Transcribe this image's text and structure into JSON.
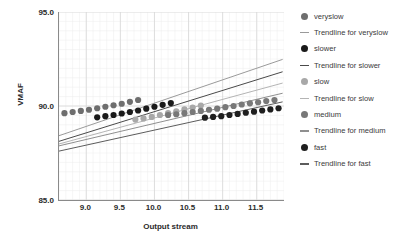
{
  "chart_data": {
    "type": "scatter",
    "title": "",
    "xlabel": "Output stream",
    "ylabel": "VMAF",
    "xlim": [
      8.6,
      11.9
    ],
    "ylim": [
      85.0,
      95.0
    ],
    "grid": true,
    "legend_position": "right",
    "xticks": [
      "9.0",
      "9.5",
      "10.0",
      "10.5",
      "11.0",
      "11.5"
    ],
    "xtick_values": [
      9.0,
      9.5,
      10.0,
      10.5,
      11.0,
      11.5
    ],
    "yticks": [
      "95.0",
      "90.0",
      "85.0"
    ],
    "ytick_values": [
      95.0,
      90.0,
      85.0
    ],
    "series": [
      {
        "name": "veryslow",
        "color": "#6e6e6e",
        "marker": "circle",
        "x": [
          8.68,
          8.8,
          8.92,
          9.04,
          9.16,
          9.28,
          9.4,
          9.52,
          9.64,
          9.76
        ],
        "y": [
          89.62,
          89.68,
          89.74,
          89.8,
          89.88,
          89.96,
          90.04,
          90.12,
          90.22,
          90.32
        ]
      },
      {
        "name": "slower",
        "color": "#1a1a1a",
        "marker": "circle",
        "x": [
          9.16,
          9.28,
          9.4,
          9.52,
          9.64,
          9.76,
          9.88,
          10.0,
          10.12,
          10.24
        ],
        "y": [
          89.4,
          89.46,
          89.52,
          89.6,
          89.68,
          89.76,
          89.86,
          89.96,
          90.06,
          90.16
        ]
      },
      {
        "name": "slow",
        "color": "#a8a8a8",
        "marker": "circle",
        "x": [
          9.72,
          9.84,
          9.96,
          10.08,
          10.2,
          10.32,
          10.44,
          10.56,
          10.68
        ],
        "y": [
          89.28,
          89.34,
          89.42,
          89.52,
          89.62,
          89.72,
          89.82,
          89.92,
          90.02
        ]
      },
      {
        "name": "medium",
        "color": "#787878",
        "marker": "circle",
        "x": [
          10.2,
          10.32,
          10.44,
          10.56,
          10.68,
          10.8,
          10.92,
          11.04,
          11.16,
          11.28,
          11.4,
          11.52,
          11.64,
          11.76
        ],
        "y": [
          89.52,
          89.56,
          89.62,
          89.68,
          89.74,
          89.8,
          89.86,
          89.94,
          90.0,
          90.08,
          90.14,
          90.2,
          90.26,
          90.32
        ]
      },
      {
        "name": "fast",
        "color": "#1f1f1f",
        "marker": "circle",
        "x": [
          10.74,
          10.86,
          10.98,
          11.1,
          11.22,
          11.34,
          11.46,
          11.58,
          11.7,
          11.82
        ],
        "y": [
          89.38,
          89.42,
          89.46,
          89.52,
          89.58,
          89.64,
          89.7,
          89.76,
          89.82,
          89.88
        ]
      }
    ],
    "trendlines": [
      {
        "name": "Trendline for veryslow",
        "color": "#9a9a9a",
        "x": [
          8.6,
          11.88
        ],
        "y": [
          88.42,
          92.48
        ]
      },
      {
        "name": "Trendline for slower",
        "color": "#4a4a4a",
        "x": [
          8.6,
          11.88
        ],
        "y": [
          88.12,
          91.82
        ]
      },
      {
        "name": "Trendline for slow",
        "color": "#b4b4b4",
        "x": [
          8.6,
          11.88
        ],
        "y": [
          87.98,
          91.22
        ]
      },
      {
        "name": "Trendline for medium",
        "color": "#8f8f8f",
        "x": [
          8.6,
          11.88
        ],
        "y": [
          87.88,
          90.68
        ]
      },
      {
        "name": "Trendline for fast",
        "color": "#5c5c5c",
        "x": [
          8.6,
          11.88
        ],
        "y": [
          87.6,
          90.22
        ]
      }
    ],
    "grid_color": "#d8d8d8",
    "minor_grid_color": "#ededed",
    "axis_color": "#8a8a8a"
  },
  "legend": {
    "items": [
      {
        "label": "veryslow",
        "kind": "dot",
        "color": "#6e6e6e"
      },
      {
        "label": "Trendline for veryslow",
        "kind": "line",
        "color": "#9a9a9a"
      },
      {
        "label": "slower",
        "kind": "dot",
        "color": "#1a1a1a"
      },
      {
        "label": "Trendline for slower",
        "kind": "line",
        "color": "#4a4a4a"
      },
      {
        "label": "slow",
        "kind": "dot",
        "color": "#a8a8a8"
      },
      {
        "label": "Trendline for slow",
        "kind": "line",
        "color": "#b4b4b4"
      },
      {
        "label": "medium",
        "kind": "dot",
        "color": "#787878"
      },
      {
        "label": "Trendline for medium",
        "kind": "line",
        "color": "#8f8f8f"
      },
      {
        "label": "fast",
        "kind": "dot",
        "color": "#1f1f1f"
      },
      {
        "label": "Trendline for fast",
        "kind": "line",
        "color": "#5c5c5c"
      }
    ]
  }
}
